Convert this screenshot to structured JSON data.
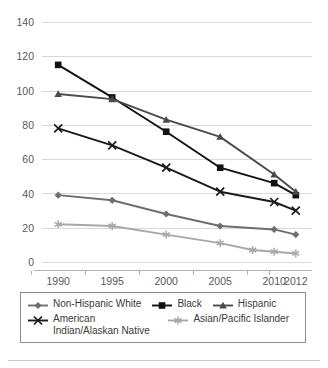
{
  "chart_data": {
    "type": "line",
    "title": "",
    "subtitle": "",
    "xlabel": "",
    "ylabel": "",
    "x": [
      "1990",
      "1995",
      "2000",
      "2005",
      "2010",
      "2012"
    ],
    "xlim": [
      1988.5,
      2013.5
    ],
    "ylim": [
      0,
      140
    ],
    "yticks": [
      0,
      20,
      40,
      60,
      80,
      100,
      120,
      140
    ],
    "grid": true,
    "legend_position": "bottom",
    "series": [
      {
        "name": "Non-Hispanic White",
        "marker": "diamond",
        "color": "#6e6e6e",
        "x": [
          1990,
          1995,
          2000,
          2005,
          2010,
          2012
        ],
        "values": [
          39,
          36,
          28,
          21,
          19,
          16
        ]
      },
      {
        "name": "Black",
        "marker": "square",
        "color": "#111111",
        "x": [
          1990,
          1995,
          2000,
          2005,
          2010,
          2012
        ],
        "values": [
          115,
          96,
          76,
          55,
          46,
          39
        ]
      },
      {
        "name": "Hispanic",
        "marker": "triangle",
        "color": "#4a4a4a",
        "x": [
          1990,
          1995,
          2000,
          2005,
          2010,
          2012
        ],
        "values": [
          98,
          95,
          83,
          73,
          51,
          41
        ]
      },
      {
        "name": "American Indian/Alaskan Native",
        "marker": "x",
        "color": "#1a1a1a",
        "x": [
          1990,
          1995,
          2000,
          2005,
          2010,
          2012
        ],
        "values": [
          78,
          68,
          55,
          41,
          35,
          30
        ]
      },
      {
        "name": "Asian/Pacific Islander",
        "marker": "asterisk",
        "color": "#a8a8a8",
        "x": [
          1990,
          1995,
          2000,
          2005,
          2008,
          2010,
          2012
        ],
        "values": [
          22,
          21,
          16,
          11,
          7,
          6,
          5
        ]
      }
    ]
  },
  "axes": {
    "y_tick_labels": [
      "140",
      "120",
      "100",
      "80",
      "60",
      "40",
      "20",
      "0"
    ],
    "x_tick_labels": [
      "1990",
      "1995",
      "2000",
      "2005",
      "2010",
      "2012"
    ]
  },
  "legend": {
    "entries": [
      {
        "label": "Non-Hispanic White",
        "marker": "diamond",
        "color": "#6e6e6e"
      },
      {
        "label": "Black",
        "marker": "square",
        "color": "#111111"
      },
      {
        "label": "Hispanic",
        "marker": "triangle",
        "color": "#4a4a4a"
      },
      {
        "label": "American Indian/Alaskan Native",
        "marker": "x",
        "color": "#1a1a1a"
      },
      {
        "label": "Asian/Pacific Islander",
        "marker": "asterisk",
        "color": "#a8a8a8"
      }
    ]
  }
}
